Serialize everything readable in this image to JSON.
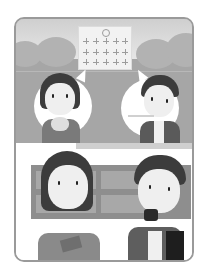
{
  "illustration": {
    "description": "Two students eating lunch at school; top panel shows school building with two thought bubbles, bottom panel shows the students eating",
    "colors": {
      "frame_border": "#9a9a9a",
      "top_background": "#a6a6a6",
      "sky": "#dadada",
      "bubble": "#ffffff",
      "hair": "#3c3c3c",
      "bag": "#1e1e1e"
    },
    "panels": [
      {
        "name": "top",
        "content": [
          "school-building",
          "girl-eating-rice-ball",
          "boy-eating-with-chopsticks"
        ]
      },
      {
        "name": "bottom",
        "content": [
          "girl-holding-bento",
          "boy-eating-rice-ball",
          "backpack"
        ]
      }
    ]
  }
}
